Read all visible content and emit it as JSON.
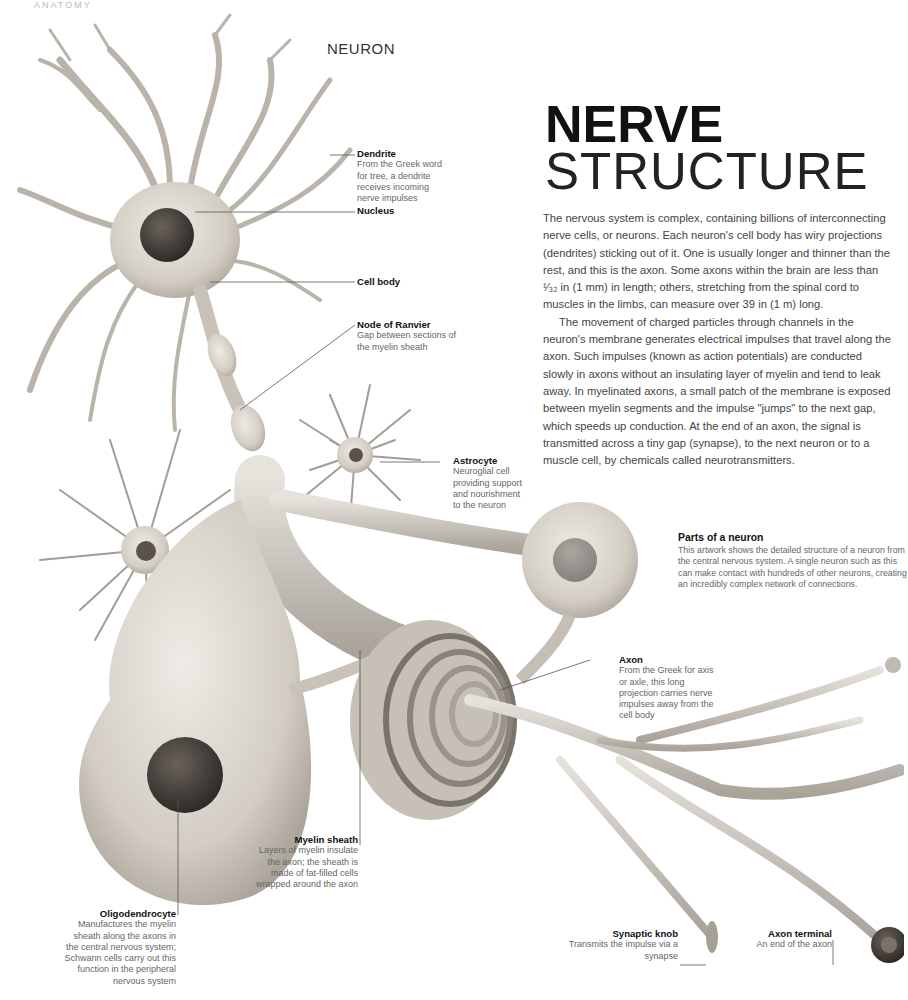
{
  "page": {
    "running_head": "ANATOMY",
    "section_label": "NEURON",
    "title_bold": "NERVE",
    "title_light": "STRUCTURE"
  },
  "body": {
    "paragraphs": [
      "The nervous system is complex, containing billions of interconnecting nerve cells, or neurons. Each neuron's cell body has wiry projections (dendrites) sticking out of it. One is usually longer and thinner than the rest, and this is the axon. Some axons within the brain are less than ¹⁄₃₂ in (1 mm) in length; others, stretching from the spinal cord to muscles in the limbs, can measure over 39 in (1 m) long.",
      "The movement of charged particles through channels in the neuron's membrane generates electrical impulses that travel along the axon. Such impulses (known as action potentials) are conducted slowly in axons without an insulating layer of myelin and tend to leak away. In myelinated axons, a small patch of the membrane is exposed between myelin segments and the impulse \"jumps\" to the next gap, which speeds up conduction. At the end of an axon, the signal is transmitted across a tiny gap (synapse), to the next neuron or to a muscle cell, by chemicals called neurotransmitters."
    ]
  },
  "parts_box": {
    "title": "Parts of a neuron",
    "text": "This artwork shows the detailed structure of a neuron from the central nervous system. A single neuron such as this can make contact with hundreds of other neurons, creating an incredibly complex network of connections."
  },
  "callouts": {
    "dendrite": {
      "title": "Dendrite",
      "text": "From the Greek word for tree, a dendrite receives incoming nerve impulses"
    },
    "nucleus": {
      "title": "Nucleus",
      "text": ""
    },
    "cell_body": {
      "title": "Cell body",
      "text": ""
    },
    "node_of_ranvier": {
      "title": "Node of Ranvier",
      "text": "Gap between sections of the myelin sheath"
    },
    "astrocyte": {
      "title": "Astrocyte",
      "text": "Neuroglial cell providing support and nourishment to the neuron"
    },
    "axon": {
      "title": "Axon",
      "text": "From the Greek for axis or axle, this long projection carries nerve impulses away from the cell body"
    },
    "myelin_sheath": {
      "title": "Myelin sheath",
      "text": "Layers of myelin insulate the axon; the sheath is made of fat-filled cells wrapped around the axon"
    },
    "oligodendrocyte": {
      "title": "Oligodendrocyte",
      "text": "Manufactures the myelin sheath along the axons in the central nervous system; Schwann cells carry out this function in the peripheral nervous system"
    },
    "synaptic_knob": {
      "title": "Synaptic knob",
      "text": "Transmits the impulse via a synapse"
    },
    "axon_terminal": {
      "title": "Axon terminal",
      "text": "An end of the axon"
    }
  },
  "colors": {
    "cell_fill": "#d9d4cc",
    "cell_shadow": "#a8a29a",
    "nucleus": "#3a3633",
    "leader_line": "#555555"
  }
}
